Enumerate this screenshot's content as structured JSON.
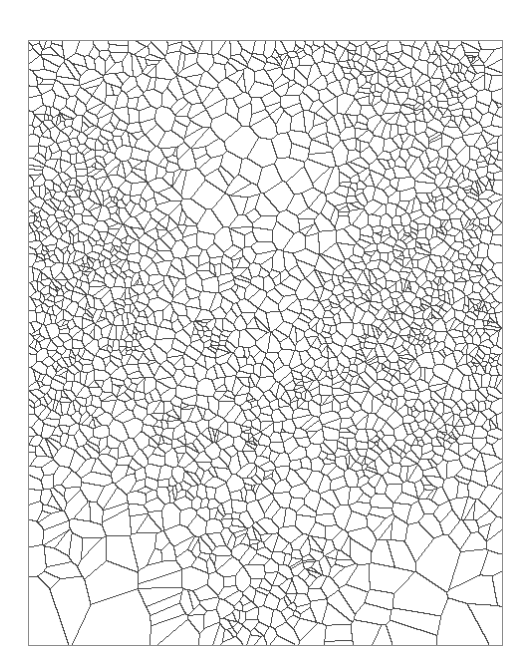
{
  "image": {
    "kind": "voronoi-tessellation",
    "background_color": "#ffffff",
    "line_color": "#4a4a4a",
    "border_color": "#8a8a8a",
    "frame": {
      "x": 28,
      "y": 40,
      "width": 475,
      "height": 606
    },
    "density_regions": [
      {
        "name": "top-band-dense",
        "cx": 0.5,
        "cy": 0.05,
        "r": 0.5,
        "weight": 1.0
      },
      {
        "name": "left-mid-dense",
        "cx": 0.05,
        "cy": 0.45,
        "r": 0.22,
        "weight": 0.9
      },
      {
        "name": "right-mid-dense",
        "cx": 0.88,
        "cy": 0.5,
        "r": 0.22,
        "weight": 0.9
      },
      {
        "name": "bottom-center-cluster",
        "cx": 0.52,
        "cy": 0.95,
        "r": 0.1,
        "weight": 0.8
      },
      {
        "name": "center-left-cluster",
        "cx": 0.4,
        "cy": 0.72,
        "r": 0.08,
        "weight": 0.6
      }
    ],
    "sparse_regions": [
      {
        "name": "upper-flower",
        "cx": 0.45,
        "cy": 0.22,
        "r": 0.17
      },
      {
        "name": "bottom-fan-left",
        "cx": 0.12,
        "cy": 1.0,
        "r": 0.2
      },
      {
        "name": "bottom-fan-right",
        "cx": 0.88,
        "cy": 1.0,
        "r": 0.2
      }
    ]
  }
}
